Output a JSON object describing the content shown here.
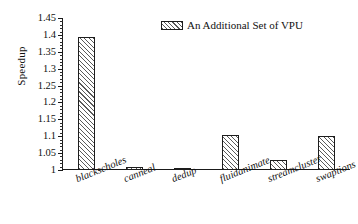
{
  "chart_data": {
    "type": "bar",
    "title": "",
    "xlabel": "",
    "ylabel": "Speedup",
    "ylim": [
      1,
      1.45
    ],
    "ytick_step": 0.05,
    "grid": false,
    "legend_position": "top-center",
    "categories": [
      "blackscholes",
      "canneal",
      "dedup",
      "fluidanimate",
      "streamcluster",
      "swaptions"
    ],
    "series": [
      {
        "name": "An Additional Set of VPU",
        "values": [
          1.395,
          1.01,
          1.005,
          1.105,
          1.03,
          1.1
        ]
      }
    ],
    "ytick_labels": [
      "1",
      "1.05",
      "1.1",
      "1.15",
      "1.2",
      "1.25",
      "1.3",
      "1.35",
      "1.4",
      "1.45"
    ],
    "ytick_values": [
      1,
      1.05,
      1.1,
      1.15,
      1.2,
      1.25,
      1.3,
      1.35,
      1.4,
      1.45
    ]
  },
  "legend": {
    "swatch_name": "hatched-swatch",
    "label": "An Additional Set of VPU"
  },
  "colors": {
    "axis": "#1a1a1a",
    "bar_edge": "#1d1d1d",
    "bar_hatch": "#5a5a5a",
    "bar_fill": "#ffffff",
    "text": "#111111"
  }
}
